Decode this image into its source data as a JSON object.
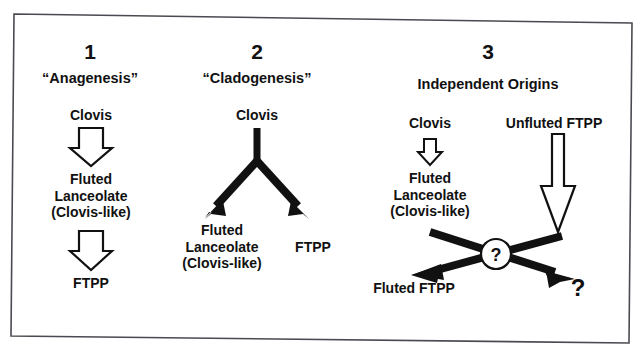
{
  "figure": {
    "background_color": "#ffffff",
    "border_color": "#4a4a52",
    "ink_color": "#111111",
    "panels": [
      {
        "number": "1",
        "title": "“Anagenesis”",
        "nodes": [
          {
            "id": "clovis",
            "text": "Clovis"
          },
          {
            "id": "fluted-lanceolate",
            "lines": [
              "Fluted",
              "Lanceolate",
              "(Clovis-like)"
            ]
          },
          {
            "id": "ftpp",
            "text": "FTPP"
          }
        ],
        "arrows": [
          {
            "id": "clovis-to-fluted-lanceolate",
            "style": "hollow-block",
            "direction": "down"
          },
          {
            "id": "fluted-lanceolate-to-ftpp",
            "style": "hollow-block",
            "direction": "down"
          }
        ]
      },
      {
        "number": "2",
        "title": "“Cladogenesis”",
        "nodes": [
          {
            "id": "clovis",
            "text": "Clovis"
          },
          {
            "id": "fluted-lanceolate",
            "lines": [
              "Fluted",
              "Lanceolate",
              "(Clovis-like)"
            ]
          },
          {
            "id": "ftpp",
            "text": "FTPP"
          }
        ],
        "arrows": [
          {
            "id": "clovis-split-left",
            "style": "solid-thick",
            "direction": "down-left"
          },
          {
            "id": "clovis-split-right",
            "style": "solid-thick",
            "direction": "down-right"
          }
        ]
      },
      {
        "number": "3",
        "title": "Independent Origins",
        "nodes": [
          {
            "id": "clovis",
            "text": "Clovis"
          },
          {
            "id": "unfluted-ftpp",
            "text": "Unfluted FTPP"
          },
          {
            "id": "fluted-lanceolate",
            "lines": [
              "Fluted",
              "Lanceolate",
              "(Clovis-like)"
            ]
          },
          {
            "id": "fluted-ftpp",
            "text": "Fluted FTPP"
          },
          {
            "id": "unknown-outcome",
            "text": "?"
          }
        ],
        "arrows": [
          {
            "id": "clovis-to-fluted-lanceolate",
            "style": "hollow-block",
            "direction": "down"
          },
          {
            "id": "unfluted-ftpp-down",
            "style": "hollow-narrow",
            "direction": "down"
          },
          {
            "id": "cross-left-to-right",
            "style": "solid-thick",
            "direction": "down-right"
          },
          {
            "id": "cross-right-to-left",
            "style": "solid-thick",
            "direction": "down-left"
          }
        ],
        "crossing_marker": {
          "id": "question-node",
          "text": "?"
        }
      }
    ]
  }
}
